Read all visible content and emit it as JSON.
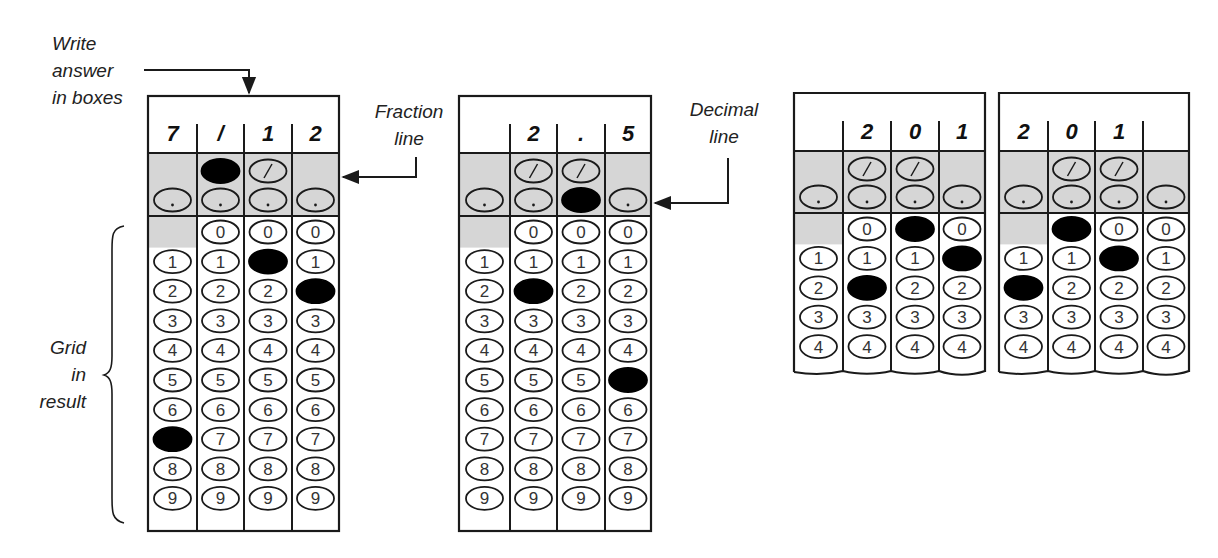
{
  "annotations": {
    "write_answer": [
      "Write",
      "answer",
      "in boxes"
    ],
    "fraction_line": [
      "Fraction",
      "line"
    ],
    "decimal_line": [
      "Decimal",
      "line"
    ],
    "grid_in_result": [
      "Grid",
      "in",
      "result"
    ]
  },
  "colors": {
    "shade": "#d6d6d6",
    "ink": "#1a1a1a",
    "fill": "#000000"
  },
  "grids": [
    {
      "id": "grid-fraction",
      "answer_boxes": [
        "7",
        "/",
        "1",
        "2"
      ],
      "filled": [
        "7",
        "/",
        "1",
        "2"
      ],
      "digits_shown": 10,
      "torn_bottom": false
    },
    {
      "id": "grid-decimal",
      "answer_boxes": [
        "",
        "2",
        ".",
        "5"
      ],
      "filled": [
        null,
        "2",
        ".",
        "5"
      ],
      "digits_shown": 10,
      "torn_bottom": false
    },
    {
      "id": "grid-201-right",
      "answer_boxes": [
        "",
        "2",
        "0",
        "1"
      ],
      "filled": [
        null,
        "2",
        "0",
        "1"
      ],
      "digits_shown": 5,
      "torn_bottom": true
    },
    {
      "id": "grid-201-left",
      "answer_boxes": [
        "2",
        "0",
        "1",
        ""
      ],
      "filled": [
        "2",
        "0",
        "1",
        null
      ],
      "digits_shown": 5,
      "torn_bottom": true
    }
  ],
  "bubble_symbols": {
    "slash": "/",
    "dot": ".",
    "digits": [
      "0",
      "1",
      "2",
      "3",
      "4",
      "5",
      "6",
      "7",
      "8",
      "9"
    ]
  }
}
